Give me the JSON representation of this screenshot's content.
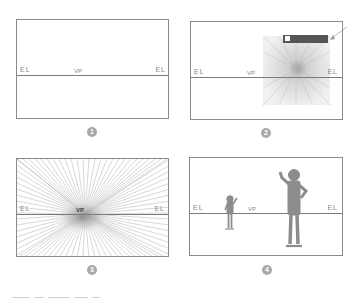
{
  "panels": [
    {
      "step": "1",
      "left_label": "EL",
      "right_label": "EL",
      "vp_label": "VP",
      "description": "Blank frame with eye level (horizon) line and vanishing point"
    },
    {
      "step": "2",
      "left_label": "EL",
      "right_label": "EL",
      "vp_label": "VP",
      "description": "Shaded radial texture patch with dark bar callout and arrow"
    },
    {
      "step": "3",
      "left_label": "EL",
      "right_label": "EL",
      "vp_label": "VP",
      "description": "Radial perspective lines converging on the vanishing point"
    },
    {
      "step": "4",
      "left_label": "EL",
      "right_label": "EL",
      "vp_label": "VP",
      "description": "Two figures of different scale standing against the eye level line"
    }
  ],
  "colors": {
    "frame": "#8a8a8a",
    "horizon": "#7a7a7a",
    "figure": "#8c8c8c",
    "badge": "#a8a8a8",
    "callout_bar": "#555555",
    "radial_lines": "#9a9a9a"
  }
}
